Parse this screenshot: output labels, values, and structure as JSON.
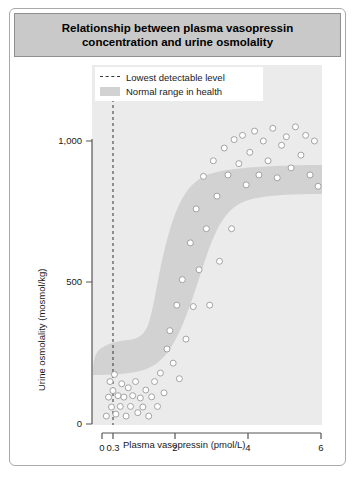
{
  "title": "Relationship between plasma vasopressin concentration and urine osmolality",
  "legend": {
    "items": [
      {
        "label": "Lowest detectable level",
        "marker": "dashed-line",
        "color": "#333333"
      },
      {
        "label": "Normal range in health",
        "marker": "band",
        "color": "#d2d2d2"
      }
    ]
  },
  "axes": {
    "x_label": "Plasma vasopressin (pmol/L)",
    "y_label": "Urine osmolality (mosmol/kg)",
    "x_ticks": [
      "0",
      "0.3",
      "2",
      "4",
      "6"
    ],
    "y_ticks": [
      "0",
      "500",
      "1,000"
    ]
  },
  "colors": {
    "panel_background": "#ebebeb",
    "band_fill": "#d2d2d2",
    "point_fill": "#ffffff",
    "point_stroke": "#9a9a9a",
    "axis": "#555555",
    "title_bar": "#c9c9c9",
    "frame": "#a9a9a9"
  },
  "chart_data": {
    "type": "scatter",
    "title": "Relationship between plasma vasopressin concentration and urine osmolality",
    "xlabel": "Plasma vasopressin (pmol/L)",
    "ylabel": "Urine osmolality (mosmol/kg)",
    "xlim": [
      0,
      6
    ],
    "ylim": [
      0,
      1100
    ],
    "x_ticks": [
      0,
      0.3,
      2,
      4,
      6
    ],
    "y_ticks": [
      0,
      500,
      1000
    ],
    "grid": false,
    "legend_position": "top-center",
    "annotations": [
      {
        "type": "vline",
        "x": 0.3,
        "style": "dashed",
        "label": "Lowest detectable level"
      },
      {
        "type": "band",
        "label": "Normal range in health",
        "shape": "sigmoid"
      }
    ],
    "band": {
      "label": "Normal range in health",
      "upper": [
        [
          0.05,
          185
        ],
        [
          0.3,
          195
        ],
        [
          0.6,
          205
        ],
        [
          0.9,
          235
        ],
        [
          1.2,
          330
        ],
        [
          1.5,
          520
        ],
        [
          1.8,
          720
        ],
        [
          2.1,
          870
        ],
        [
          2.5,
          960
        ],
        [
          3.0,
          1010
        ],
        [
          3.6,
          1040
        ],
        [
          4.4,
          1055
        ],
        [
          5.2,
          1062
        ],
        [
          6.0,
          1065
        ]
      ],
      "lower": [
        [
          0.05,
          10
        ],
        [
          0.4,
          10
        ],
        [
          0.8,
          15
        ],
        [
          1.1,
          30
        ],
        [
          1.4,
          75
        ],
        [
          1.7,
          150
        ],
        [
          2.0,
          250
        ],
        [
          2.3,
          375
        ],
        [
          2.6,
          505
        ],
        [
          2.9,
          620
        ],
        [
          3.2,
          705
        ],
        [
          3.6,
          765
        ],
        [
          4.2,
          795
        ],
        [
          5.0,
          810
        ],
        [
          6.0,
          815
        ]
      ]
    },
    "series": [
      {
        "name": "Subjects",
        "marker": "circle",
        "points": [
          [
            0.12,
            28
          ],
          [
            0.18,
            95
          ],
          [
            0.22,
            150
          ],
          [
            0.26,
            60
          ],
          [
            0.3,
            118
          ],
          [
            0.34,
            175
          ],
          [
            0.38,
            35
          ],
          [
            0.44,
            100
          ],
          [
            0.5,
            62
          ],
          [
            0.54,
            142
          ],
          [
            0.6,
            95
          ],
          [
            0.66,
            28
          ],
          [
            0.72,
            128
          ],
          [
            0.78,
            62
          ],
          [
            0.84,
            100
          ],
          [
            0.92,
            150
          ],
          [
            0.98,
            40
          ],
          [
            1.05,
            92
          ],
          [
            1.12,
            60
          ],
          [
            1.2,
            120
          ],
          [
            1.28,
            28
          ],
          [
            1.36,
            96
          ],
          [
            1.44,
            150
          ],
          [
            1.52,
            62
          ],
          [
            1.6,
            180
          ],
          [
            1.7,
            110
          ],
          [
            1.78,
            265
          ],
          [
            1.86,
            330
          ],
          [
            1.95,
            215
          ],
          [
            2.05,
            420
          ],
          [
            2.12,
            160
          ],
          [
            2.2,
            510
          ],
          [
            2.3,
            300
          ],
          [
            2.42,
            640
          ],
          [
            2.5,
            415
          ],
          [
            2.58,
            760
          ],
          [
            2.66,
            545
          ],
          [
            2.78,
            875
          ],
          [
            2.86,
            690
          ],
          [
            2.95,
            420
          ],
          [
            3.05,
            930
          ],
          [
            3.15,
            805
          ],
          [
            3.22,
            575
          ],
          [
            3.35,
            975
          ],
          [
            3.45,
            880
          ],
          [
            3.55,
            690
          ],
          [
            3.62,
            1005
          ],
          [
            3.75,
            920
          ],
          [
            3.85,
            1020
          ],
          [
            3.95,
            845
          ],
          [
            4.05,
            960
          ],
          [
            4.18,
            1035
          ],
          [
            4.3,
            880
          ],
          [
            4.42,
            1000
          ],
          [
            4.55,
            930
          ],
          [
            4.68,
            1045
          ],
          [
            4.8,
            870
          ],
          [
            4.92,
            985
          ],
          [
            5.05,
            1015
          ],
          [
            5.18,
            905
          ],
          [
            5.3,
            1050
          ],
          [
            5.45,
            950
          ],
          [
            5.58,
            1020
          ],
          [
            5.7,
            880
          ],
          [
            5.82,
            1000
          ],
          [
            5.92,
            840
          ]
        ]
      }
    ]
  }
}
